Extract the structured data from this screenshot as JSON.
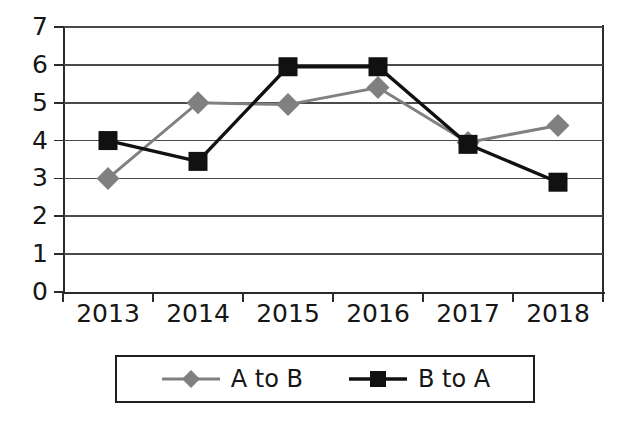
{
  "chart_data": {
    "type": "line",
    "title": "",
    "xlabel": "",
    "ylabel": "",
    "categories": [
      "2013",
      "2014",
      "2015",
      "2016",
      "2017",
      "2018"
    ],
    "ylim": [
      0,
      7
    ],
    "ytick_labels": [
      "0",
      "1",
      "2",
      "3",
      "4",
      "5",
      "6",
      "7"
    ],
    "ytick_values": [
      0,
      1,
      2,
      3,
      4,
      5,
      6,
      7
    ],
    "grid": true,
    "legend_position": "bottom",
    "series": [
      {
        "name": "A to B",
        "color": "#808080",
        "marker": "diamond",
        "values": [
          3,
          5,
          4.95,
          5.4,
          3.95,
          4.4
        ]
      },
      {
        "name": "B to A",
        "color": "#111111",
        "marker": "square",
        "values": [
          4,
          3.45,
          5.95,
          5.95,
          3.9,
          2.9
        ]
      }
    ]
  },
  "legend": {
    "entries": [
      {
        "label": "A to B"
      },
      {
        "label": "B to A"
      }
    ]
  },
  "colors": {
    "series_a": "#808080",
    "series_b": "#111111",
    "axis": "#2b2b2b",
    "grid": "#4a4a4a",
    "background": "#ffffff"
  }
}
